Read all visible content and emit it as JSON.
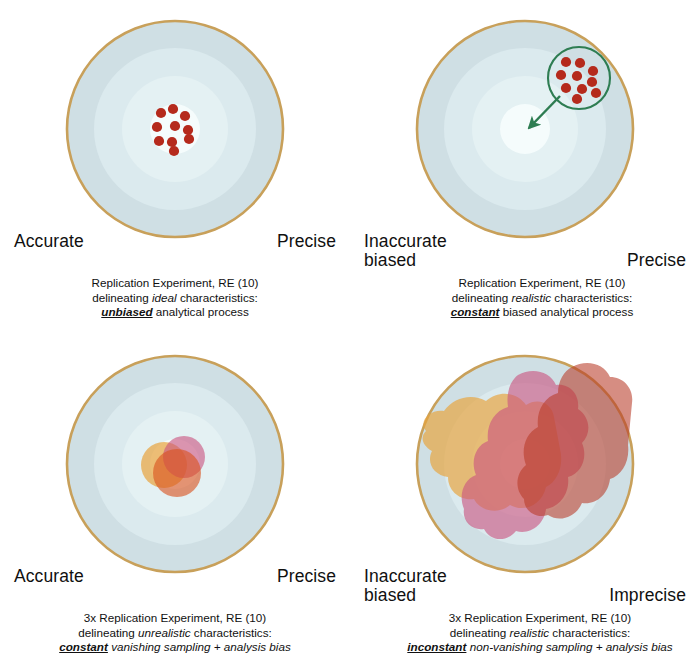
{
  "figure": {
    "colors": {
      "rim": "#c8a05a",
      "ring_outer": "#cfdfe4",
      "ring_mid": "#dcebee",
      "ring_inner": "#e6f2f4",
      "bullseye": "#f4fbfb",
      "dot_red": "#b52a1c",
      "circle_green": "#2e7d52",
      "blob_gold": "#e8a33c",
      "blob_pink": "#c9547f",
      "blob_red": "#b93b28",
      "text": "#101010"
    }
  },
  "panels": [
    {
      "id": "top-left",
      "axis_left": "Accurate",
      "axis_right": "Precise",
      "caption": {
        "line1": "Replication Experiment, RE (10)",
        "line2_pre": "delineating ",
        "line2_em": "ideal",
        "line2_post": " characteristics:",
        "line3_key": "unbiased",
        "line3_post": " analytical process"
      },
      "marks": {
        "kind": "dots-centered",
        "count": 10,
        "dots": [
          [
            -14,
            -16
          ],
          [
            -2,
            -20
          ],
          [
            10,
            -13
          ],
          [
            -18,
            -2
          ],
          [
            0,
            -3
          ],
          [
            13,
            1
          ],
          [
            -16,
            12
          ],
          [
            -3,
            13
          ],
          [
            14,
            10
          ],
          [
            -1,
            22
          ]
        ]
      }
    },
    {
      "id": "top-right",
      "axis_left": "Inaccurate\nbiased",
      "axis_right": "Precise",
      "caption": {
        "line1": "Replication Experiment, RE (10)",
        "line2_pre": "delineating ",
        "line2_em": "realistic",
        "line2_post": " characteristics:",
        "line3_key": "constant",
        "line3_post": " biased analytical process"
      },
      "marks": {
        "kind": "dots-offset-circled",
        "count": 10,
        "circle_center": [
          52,
          -42
        ],
        "circle_radius": 31,
        "arrow_from": [
          32,
          -20
        ],
        "arrow_to": [
          3,
          5
        ],
        "dots": [
          [
            40,
            -58
          ],
          [
            54,
            -56
          ],
          [
            66,
            -48
          ],
          [
            36,
            -44
          ],
          [
            50,
            -42
          ],
          [
            64,
            -38
          ],
          [
            42,
            -32
          ],
          [
            56,
            -28
          ],
          [
            68,
            -28
          ],
          [
            52,
            -22
          ]
        ]
      }
    },
    {
      "id": "bottom-left",
      "axis_left": "Accurate",
      "axis_right": "Precise",
      "caption": {
        "line1": "3x Replication Experiment, RE (10)",
        "line2_pre": "delineating ",
        "line2_em": "unrealistic",
        "line2_post": " characteristics:",
        "line3_key": "constant",
        "line3_post": " vanishing sampling + analysis bias"
      },
      "marks": {
        "kind": "blobs-small",
        "count": 3,
        "blobs": [
          {
            "color": "blob_gold",
            "cx": -11,
            "cy": 1,
            "r": 23
          },
          {
            "color": "blob_pink",
            "cx": 9,
            "cy": -7,
            "r": 21
          },
          {
            "color": "blob_red",
            "cx": 2,
            "cy": 9,
            "r": 24
          }
        ]
      }
    },
    {
      "id": "bottom-right",
      "axis_left": "Inaccurate\nbiased",
      "axis_right": "Imprecise",
      "caption": {
        "line1": "3x Replication Experiment, RE (10)",
        "line2_pre": "delineating ",
        "line2_em": "realistic",
        "line2_post": " characteristics:",
        "line3_key": "inconstant",
        "line3_post": " non-vanishing sampling + analysis bias"
      },
      "marks": {
        "kind": "blobs-large",
        "count": 3
      }
    }
  ]
}
